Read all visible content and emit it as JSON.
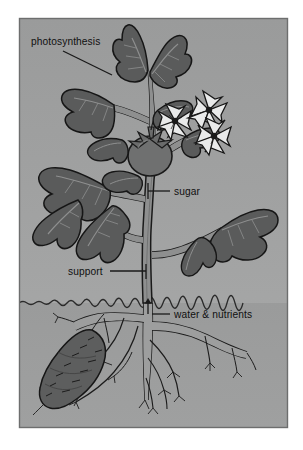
{
  "figure": {
    "style": "grayscale line illustration in bordered panel"
  },
  "panel": {
    "border_color": "#6d6e6e",
    "sky_color_top": "#9b9c9c",
    "sky_color_bottom": "#a6a7a7",
    "ground_color": "#9a9b9b",
    "ground_line_color": "#2a2a2a"
  },
  "palette": {
    "leaf_fill": "#5a5b5b",
    "leaf_outline": "#161616",
    "leaf_vein": "#8e8f8f",
    "stem_fill": "#8e8f8f",
    "stem_outline": "#1a1a1a",
    "fruit_fill": "#6f7070",
    "fruit_outline": "#1a1a1a",
    "flower_fill": "#e9eaea",
    "flower_outline": "#161616",
    "flower_center": "#1a1a1a",
    "root_fill": "#9d9e9e",
    "root_outline": "#1c1c1c",
    "tuber_fill": "#5d5e5e",
    "tuber_outline": "#161616",
    "label_color": "#101010",
    "leader_color": "#1a1a1a"
  },
  "labels": [
    {
      "id": "photosynthesis",
      "text": "photosynthesis",
      "text_x": 31,
      "text_y": 45,
      "anchor": "start",
      "leader": {
        "x1": 63,
        "y1": 51,
        "x2": 112,
        "y2": 75
      },
      "points_to": "upper leaf"
    },
    {
      "id": "sugar",
      "text": "sugar",
      "text_x": 174,
      "text_y": 195,
      "anchor": "start",
      "leader": {
        "x1": 170,
        "y1": 191,
        "x2": 148,
        "y2": 191
      },
      "tick": {
        "x": 148,
        "y1": 183,
        "y2": 199
      },
      "points_to": "main stem below fruit"
    },
    {
      "id": "support",
      "text": "support",
      "text_x": 68,
      "text_y": 275,
      "anchor": "start",
      "leader": {
        "x1": 110,
        "y1": 271,
        "x2": 146,
        "y2": 271
      },
      "tick": {
        "x": 146,
        "y1": 264,
        "y2": 279
      },
      "points_to": "main stem"
    },
    {
      "id": "water-nutrients",
      "text": "water & nutrients",
      "text_x": 174,
      "text_y": 318,
      "anchor": "start",
      "leader": {
        "x1": 170,
        "y1": 314,
        "x2": 152,
        "y2": 314
      },
      "points_to": "root zone at soil line"
    }
  ],
  "arrow": {
    "id": "uptake-arrow",
    "description": "upward arrow in stem at soil line",
    "x": 148,
    "y_bottom": 314,
    "y_top": 300
  },
  "soil_line": {
    "y": 303,
    "wave_amplitude": 2.5,
    "description": "wavy ground surface line spanning panel width"
  },
  "plant_parts": [
    {
      "name": "leaf",
      "count": 12,
      "region": "above ground"
    },
    {
      "name": "flower",
      "count": 3,
      "region": "upper right"
    },
    {
      "name": "fruit",
      "count": 1,
      "region": "center"
    },
    {
      "name": "stem",
      "count": 1,
      "region": "center vertical"
    },
    {
      "name": "tuber",
      "count": 1,
      "region": "below ground left"
    },
    {
      "name": "root",
      "count": 1,
      "region": "below ground"
    }
  ]
}
